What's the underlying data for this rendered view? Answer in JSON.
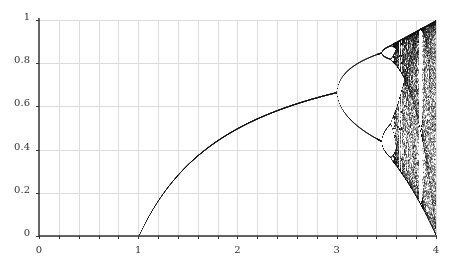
{
  "chart_data": {
    "type": "scatter",
    "title": "",
    "xlabel": "",
    "ylabel": "",
    "xlim": [
      0,
      4
    ],
    "ylim": [
      0,
      1
    ],
    "x_ticks": [
      "0",
      "1",
      "2",
      "3",
      "4"
    ],
    "y_ticks": [
      "0",
      "0.2",
      "0.4",
      "0.6",
      "0.8",
      "1"
    ],
    "minor_x_step": 0.2,
    "grid": true,
    "features": [
      {
        "r": 1.0,
        "x": 0.0,
        "note": "transcritical point, curve begins"
      },
      {
        "r": 3.0,
        "x": 0.667,
        "note": "first period-doubling bifurcation"
      },
      {
        "r": 3.449,
        "x": [
          0.44,
          0.85
        ],
        "note": "second period-doubling"
      },
      {
        "r": 3.57,
        "note": "onset of chaos"
      },
      {
        "r": 4.0,
        "x": [
          0,
          1
        ],
        "note": "full chaos"
      }
    ],
    "series": [
      {
        "name": "attractor",
        "r_start": 0.0,
        "r_end": 4.0,
        "map": "logistic"
      }
    ]
  },
  "colors": {
    "grid": "#dcdcdc",
    "axis": "#333333",
    "points": "#111111"
  }
}
